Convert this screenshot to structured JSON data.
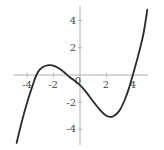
{
  "chart_data": {
    "type": "line",
    "title": "",
    "xlabel": "",
    "ylabel": "",
    "xlim": [
      -5,
      5
    ],
    "ylim": [
      -5,
      5
    ],
    "grid": false,
    "x_ticks": [
      -4,
      -2,
      0,
      2,
      4
    ],
    "y_ticks": [
      4,
      2,
      -2,
      -4
    ],
    "x_tick_labels": [
      "-4",
      "-2",
      "0",
      "2",
      "4"
    ],
    "y_tick_labels": [
      "4",
      "2",
      "-2",
      "-4"
    ],
    "series": [
      {
        "name": "f(x)",
        "x": [
          -4.8,
          -4.4,
          -4.0,
          -3.6,
          -3.3,
          -3.0,
          -2.6,
          -2.1,
          -1.6,
          -1.2,
          -0.8,
          -0.5,
          0,
          0.5,
          1.0,
          1.5,
          2.0,
          2.5,
          3.0,
          3.4,
          3.7,
          4.0,
          4.4,
          4.8,
          5.1
        ],
        "y": [
          -5.0,
          -3.4,
          -2.0,
          -0.8,
          0.0,
          0.45,
          0.68,
          0.7,
          0.5,
          0.2,
          -0.15,
          -0.35,
          -0.75,
          -1.3,
          -1.95,
          -2.55,
          -3.0,
          -3.05,
          -2.6,
          -1.8,
          -1.0,
          0.0,
          1.4,
          3.0,
          4.8
        ],
        "color": "#2a2a2a"
      }
    ],
    "features": {
      "roots": [
        -3.3,
        -0.5,
        4.0
      ],
      "local_max": [
        -2.1,
        0.7
      ],
      "local_min": [
        2.0,
        -3.0
      ],
      "y_intercept": -0.75
    }
  },
  "axes": {
    "x_labels": [
      "-4",
      "-2",
      "0",
      "2",
      "4"
    ],
    "y_labels": [
      "4",
      "2",
      "-2",
      "-4"
    ],
    "axis_color": "#b0b0b0",
    "curve_color": "#2a2a2a"
  }
}
